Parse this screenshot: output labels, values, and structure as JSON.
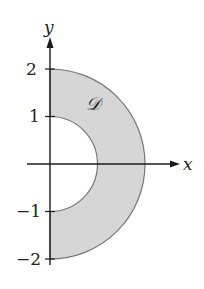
{
  "diagram": {
    "type": "region-plot",
    "axes": {
      "x_label": "x",
      "y_label": "y",
      "y_ticks": [
        {
          "value": 2,
          "label": "2"
        },
        {
          "value": 1,
          "label": "1"
        },
        {
          "value": -1,
          "label": "−1"
        },
        {
          "value": -2,
          "label": "−2"
        }
      ]
    },
    "region": {
      "label": "𝒟",
      "inner_radius": 1,
      "outer_radius": 2,
      "fill_color": "#d6d6d6",
      "stroke_color": "#777777"
    },
    "colors": {
      "axis": "#1a1a1a",
      "background": "#ffffff"
    }
  }
}
